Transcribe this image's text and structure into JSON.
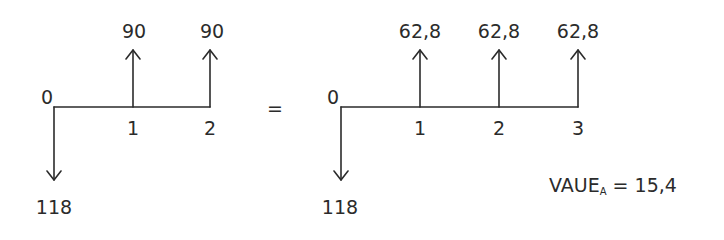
{
  "left_diagram": {
    "origin_label": "0",
    "initial_outflow": "118",
    "periods": [
      {
        "label": "1",
        "inflow": "90"
      },
      {
        "label": "2",
        "inflow": "90"
      }
    ]
  },
  "equals_sign": "=",
  "right_diagram": {
    "origin_label": "0",
    "initial_outflow": "118",
    "periods": [
      {
        "label": "1",
        "inflow": "62,8"
      },
      {
        "label": "2",
        "inflow": "62,8"
      },
      {
        "label": "3",
        "inflow": "62,8"
      }
    ]
  },
  "result": {
    "name": "VAUE",
    "subscript": "A",
    "operator": "=",
    "value": "15,4"
  },
  "colors": {
    "line": "#2b2b2b",
    "text": "#2b2b2b"
  }
}
